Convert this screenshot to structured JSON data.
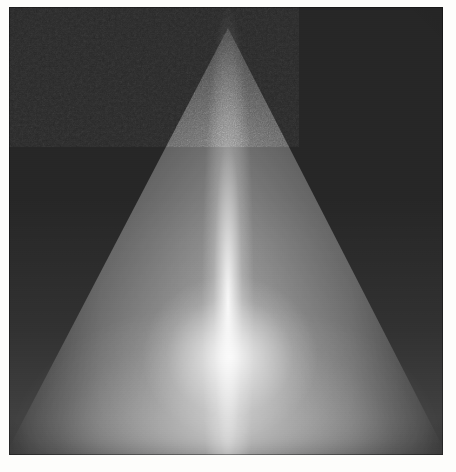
{
  "figure": {
    "kind": "grayscale-intensity-image",
    "alt_text": "Bright conical plume on a dark grainy background",
    "media_type": "scanned-photograph",
    "colormap": "grayscale",
    "width_px": 456,
    "height_px": 472,
    "paper_color": "#fdfdfb",
    "plate": {
      "left_px": 9,
      "top_px": 7,
      "width_px": 434,
      "height_px": 448,
      "background_color": "#262626",
      "highlight_color": "#ffffff"
    }
  },
  "chart_data": {
    "type": "heatmap",
    "title": "",
    "subtitle": "",
    "xlabel": "",
    "ylabel": "",
    "legend": [],
    "grid": false,
    "colormap": "gray",
    "xlim": [
      0,
      434
    ],
    "ylim": [
      0,
      448
    ],
    "value_range": [
      0,
      255
    ],
    "annotations": [],
    "features": [
      {
        "name": "cone-apex",
        "x": 219,
        "y": 21,
        "intensity": 110,
        "note": "narrow bright tip of the plume near the top centre of the plate"
      },
      {
        "name": "cone-axis-streak",
        "x": 219,
        "y": 240,
        "intensity": 235,
        "note": "near-vertical high intensity streak down the cone axis"
      },
      {
        "name": "cone-hot-spot",
        "x": 221,
        "y": 350,
        "intensity": 252,
        "note": "brightest, nearly saturated region in the lower middle of the plume"
      },
      {
        "name": "cone-base-left",
        "x": 30,
        "y": 440,
        "intensity": 120,
        "note": "left end of the broad glowing base"
      },
      {
        "name": "cone-base-right",
        "x": 410,
        "y": 440,
        "intensity": 118,
        "note": "right end of the broad glowing base"
      },
      {
        "name": "background-top-left",
        "x": 35,
        "y": 35,
        "intensity": 36,
        "note": "dark grainy background corner"
      },
      {
        "name": "background-top-right",
        "x": 400,
        "y": 35,
        "intensity": 38,
        "note": "dark grainy background corner"
      }
    ],
    "profile_x_at_y240": {
      "x": [
        10,
        60,
        110,
        150,
        185,
        205,
        219,
        235,
        265,
        300,
        345,
        390,
        425
      ],
      "values": [
        34,
        40,
        58,
        92,
        150,
        205,
        238,
        206,
        148,
        104,
        62,
        42,
        34
      ]
    },
    "profile_y_on_axis": {
      "y": [
        20,
        60,
        110,
        160,
        210,
        260,
        310,
        350,
        390,
        425,
        445
      ],
      "values": [
        92,
        128,
        158,
        182,
        206,
        226,
        244,
        252,
        238,
        196,
        150
      ]
    },
    "profile_x_at_y430": {
      "x": [
        10,
        60,
        110,
        160,
        210,
        260,
        310,
        360,
        410,
        425
      ],
      "values": [
        86,
        112,
        134,
        152,
        162,
        158,
        142,
        124,
        104,
        96
      ]
    }
  }
}
